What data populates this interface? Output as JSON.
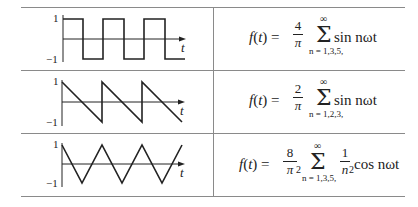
{
  "table": {
    "rows": [
      {
        "waveform": "square",
        "y_ticks": {
          "top": "1",
          "bottom": "−1"
        },
        "x_label": "t",
        "formula": {
          "lhs": "f(t) =",
          "coef_num": "4",
          "coef_den": "π",
          "coef_den_exp": "",
          "sum_upper": "∞",
          "sum_symbol": "Σ",
          "sum_lower": "n = 1,3,5,",
          "term_prefix": "",
          "term": "sin nωt"
        }
      },
      {
        "waveform": "sawtooth",
        "y_ticks": {
          "top": "1",
          "bottom": "−1"
        },
        "x_label": "t",
        "formula": {
          "lhs": "f(t) =",
          "coef_num": "2",
          "coef_den": "π",
          "coef_den_exp": "",
          "sum_upper": "∞",
          "sum_symbol": "Σ",
          "sum_lower": "n = 1,2,3,",
          "term_prefix": "",
          "term": "sin nωt"
        }
      },
      {
        "waveform": "triangle",
        "y_ticks": {
          "top": "1",
          "bottom": "−1"
        },
        "x_label": "t",
        "formula": {
          "lhs": "f(t) =",
          "coef_num": "8",
          "coef_den": "π",
          "coef_den_exp": "2",
          "sum_upper": "∞",
          "sum_symbol": "Σ",
          "sum_lower": "n = 1,3,5,",
          "term_prefix_num": "1",
          "term_prefix_den": "n",
          "term_prefix_den_exp": "2",
          "term": "cos nωt"
        }
      }
    ]
  },
  "colors": {
    "line": "#222222",
    "rule": "#8a8a8a"
  }
}
